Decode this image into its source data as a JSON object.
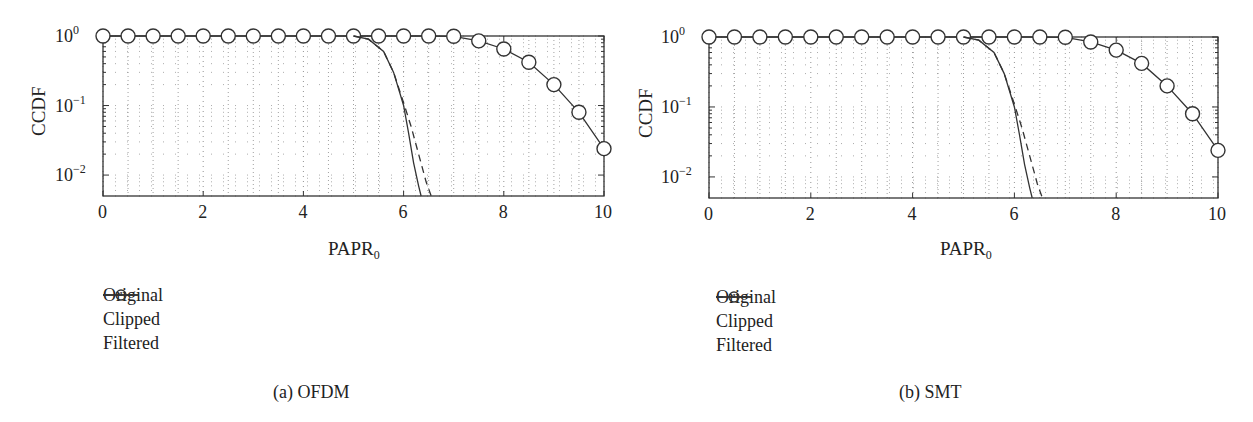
{
  "figure": {
    "panels": [
      {
        "caption": "(a) OFDM",
        "xlabel": "PAPR",
        "xlabel_sub": "0",
        "ylabel": "CCDF",
        "xticks": [
          "0",
          "2",
          "4",
          "6",
          "8",
          "10"
        ],
        "yticks": [
          {
            "base": "10",
            "exp": "0"
          },
          {
            "base": "10",
            "exp": "−1"
          },
          {
            "base": "10",
            "exp": "−2"
          }
        ],
        "legend": [
          "Original",
          "Clipped",
          "Filtered"
        ]
      },
      {
        "caption": "(b) SMT",
        "xlabel": "PAPR",
        "xlabel_sub": "0",
        "ylabel": "CCDF",
        "xticks": [
          "0",
          "2",
          "4",
          "6",
          "8",
          "10"
        ],
        "yticks": [
          {
            "base": "10",
            "exp": "0"
          },
          {
            "base": "10",
            "exp": "−1"
          },
          {
            "base": "10",
            "exp": "−2"
          }
        ],
        "legend": [
          "Original",
          "Clipped",
          "Filtered"
        ]
      }
    ]
  },
  "chart_data": [
    {
      "type": "line",
      "title": "(a) OFDM",
      "xlabel": "PAPR0",
      "ylabel": "CCDF",
      "xlim": [
        0,
        10
      ],
      "ylim": [
        0.005,
        1
      ],
      "yscale": "log",
      "grid": true,
      "legend_position": "below-left",
      "series": [
        {
          "name": "Original",
          "style": "solid-circle-markers",
          "x": [
            0,
            0.5,
            1,
            1.5,
            2,
            2.5,
            3,
            3.5,
            4,
            4.5,
            5,
            5.5,
            6,
            6.5,
            7,
            7.5,
            8,
            8.5,
            9,
            9.5,
            10
          ],
          "y": [
            1,
            1,
            1,
            1,
            1,
            1,
            1,
            1,
            1,
            1,
            1,
            1,
            1,
            1,
            0.99,
            0.85,
            0.65,
            0.42,
            0.2,
            0.08,
            0.024
          ]
        },
        {
          "name": "Clipped",
          "style": "solid",
          "x": [
            5,
            5.3,
            5.6,
            5.8,
            6.0,
            6.1,
            6.2,
            6.3,
            6.35
          ],
          "y": [
            1,
            0.9,
            0.6,
            0.3,
            0.1,
            0.04,
            0.015,
            0.007,
            0.005
          ]
        },
        {
          "name": "Filtered",
          "style": "dashed",
          "x": [
            5,
            5.3,
            5.6,
            5.8,
            6.0,
            6.15,
            6.3,
            6.45,
            6.55
          ],
          "y": [
            1,
            0.9,
            0.6,
            0.3,
            0.11,
            0.05,
            0.02,
            0.008,
            0.005
          ]
        }
      ]
    },
    {
      "type": "line",
      "title": "(b) SMT",
      "xlabel": "PAPR0",
      "ylabel": "CCDF",
      "xlim": [
        0,
        10
      ],
      "ylim": [
        0.005,
        1
      ],
      "yscale": "log",
      "grid": true,
      "legend_position": "below-left",
      "series": [
        {
          "name": "Original",
          "style": "solid-circle-markers",
          "x": [
            0,
            0.5,
            1,
            1.5,
            2,
            2.5,
            3,
            3.5,
            4,
            4.5,
            5,
            5.5,
            6,
            6.5,
            7,
            7.5,
            8,
            8.5,
            9,
            9.5,
            10
          ],
          "y": [
            1,
            1,
            1,
            1,
            1,
            1,
            1,
            1,
            1,
            1,
            1,
            1,
            1,
            1,
            0.99,
            0.85,
            0.65,
            0.42,
            0.2,
            0.08,
            0.024
          ]
        },
        {
          "name": "Clipped",
          "style": "solid",
          "x": [
            5,
            5.3,
            5.6,
            5.8,
            6.0,
            6.1,
            6.2,
            6.3,
            6.35
          ],
          "y": [
            1,
            0.9,
            0.6,
            0.3,
            0.1,
            0.04,
            0.015,
            0.007,
            0.005
          ]
        },
        {
          "name": "Filtered",
          "style": "dashed",
          "x": [
            5,
            5.3,
            5.6,
            5.8,
            6.0,
            6.15,
            6.3,
            6.45,
            6.55
          ],
          "y": [
            1,
            0.9,
            0.6,
            0.3,
            0.11,
            0.05,
            0.02,
            0.008,
            0.005
          ]
        }
      ]
    }
  ]
}
